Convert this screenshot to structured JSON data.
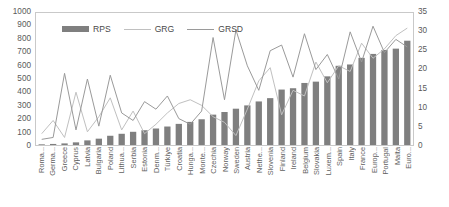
{
  "legend": {
    "position": "top-left-inside",
    "items": [
      {
        "label": "RPS",
        "type": "bar",
        "color": "#7f7f7f"
      },
      {
        "label": "GRG",
        "type": "line",
        "color": "#c0c0c0"
      },
      {
        "label": "GRSD",
        "type": "line",
        "color": "#9a9a9a"
      }
    ]
  },
  "axes": {
    "left_ticks": [
      "1000",
      "900",
      "800",
      "700",
      "600",
      "500",
      "400",
      "300",
      "200",
      "100",
      "0"
    ],
    "right_ticks": [
      "35",
      "30",
      "25",
      "20",
      "15",
      "10",
      "5",
      "0"
    ]
  },
  "chart_data": {
    "type": "bar",
    "title": "",
    "xlabel": "",
    "ylabel": "",
    "y2label": "",
    "ylim": [
      0,
      1000
    ],
    "y2lim": [
      0,
      35
    ],
    "grid": false,
    "legend_position": "top-left-inside",
    "categories": [
      "Roma...",
      "Germa...",
      "Greece",
      "Cyprus",
      "Latvia",
      "Bulgaria",
      "Poland",
      "Lithua...",
      "Serbia",
      "Estonia",
      "Denm...",
      "Türkiye",
      "Croatia",
      "Hunga...",
      "Monte...",
      "Czechia",
      "Norway",
      "Sweden",
      "Austria",
      "Nethe...",
      "Slovenia",
      "Finland",
      "Ireland",
      "Belgium",
      "Slovakia",
      "Luxem...",
      "Spain",
      "Italy",
      "France",
      "Europ...",
      "Portugal",
      "Malta",
      "Euro..."
    ],
    "series": [
      {
        "name": "RPS",
        "type": "bar",
        "axis": "left",
        "color": "#7f7f7f",
        "values": [
          5,
          8,
          12,
          20,
          35,
          48,
          70,
          85,
          100,
          112,
          125,
          140,
          160,
          175,
          195,
          230,
          250,
          275,
          300,
          330,
          355,
          420,
          430,
          470,
          480,
          520,
          600,
          610,
          660,
          690,
          720,
          730,
          790
        ]
      },
      {
        "name": "GRG",
        "type": "line",
        "axis": "right",
        "color": "#c0c0c0",
        "values": [
          3.0,
          6.5,
          2.0,
          14.0,
          3.5,
          7.5,
          12.5,
          4.0,
          9.0,
          3.0,
          5.5,
          8.5,
          11.0,
          12.0,
          10.5,
          7.5,
          6.0,
          2.5,
          9.5,
          17.0,
          20.5,
          8.0,
          14.5,
          13.0,
          22.0,
          16.5,
          21.0,
          19.5,
          27.0,
          23.0,
          25.5,
          29.0,
          31.0
        ]
      },
      {
        "name": "GRSD",
        "type": "line",
        "axis": "right",
        "color": "#9a9a9a",
        "values": [
          1.5,
          2.0,
          19.0,
          4.0,
          17.5,
          5.0,
          18.5,
          8.5,
          6.5,
          11.5,
          9.5,
          13.0,
          7.0,
          5.5,
          9.0,
          28.5,
          12.0,
          30.5,
          21.0,
          14.5,
          25.0,
          26.5,
          18.0,
          29.5,
          20.0,
          24.0,
          17.5,
          30.0,
          22.0,
          31.5,
          24.5,
          28.0,
          26.0
        ]
      }
    ]
  }
}
